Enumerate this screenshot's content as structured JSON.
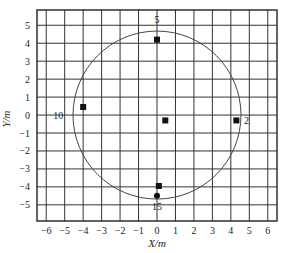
{
  "chart_data": {
    "type": "scatter",
    "title": "",
    "xlabel": "X/m",
    "ylabel": "Y/m",
    "xlim": [
      -6.5,
      6.5
    ],
    "ylim": [
      -5.9,
      5.85
    ],
    "xticks": [
      -6,
      -5,
      -4,
      -3,
      -2,
      -1,
      0,
      1,
      2,
      3,
      4,
      5,
      6
    ],
    "yticks": [
      -5,
      -4,
      -3,
      -2,
      -1,
      0,
      1,
      2,
      3,
      4,
      5
    ],
    "grid": true,
    "circle": {
      "cx": 0.0,
      "cy": 0.0,
      "r": 4.55
    },
    "series": [
      {
        "name": "square-markers",
        "marker": "square",
        "points": [
          {
            "x": 0.0,
            "y": 4.2,
            "label": ""
          },
          {
            "x": 4.3,
            "y": -0.3,
            "label": ""
          },
          {
            "x": -4.0,
            "y": 0.45,
            "label": ""
          },
          {
            "x": 0.45,
            "y": -0.3,
            "label": ""
          },
          {
            "x": 0.1,
            "y": -3.95,
            "label": ""
          }
        ]
      },
      {
        "name": "circle-markers",
        "marker": "dot",
        "points": [
          {
            "x": 0.0,
            "y": -4.5,
            "label": ""
          }
        ]
      }
    ],
    "annotations": [
      {
        "text": "5",
        "x": 0.0,
        "y": 5.3
      },
      {
        "text": "2",
        "x": 4.85,
        "y": -0.3
      },
      {
        "text": "10",
        "x": -5.35,
        "y": 0.0
      },
      {
        "text": "15",
        "x": 0.0,
        "y": -5.1
      }
    ]
  }
}
